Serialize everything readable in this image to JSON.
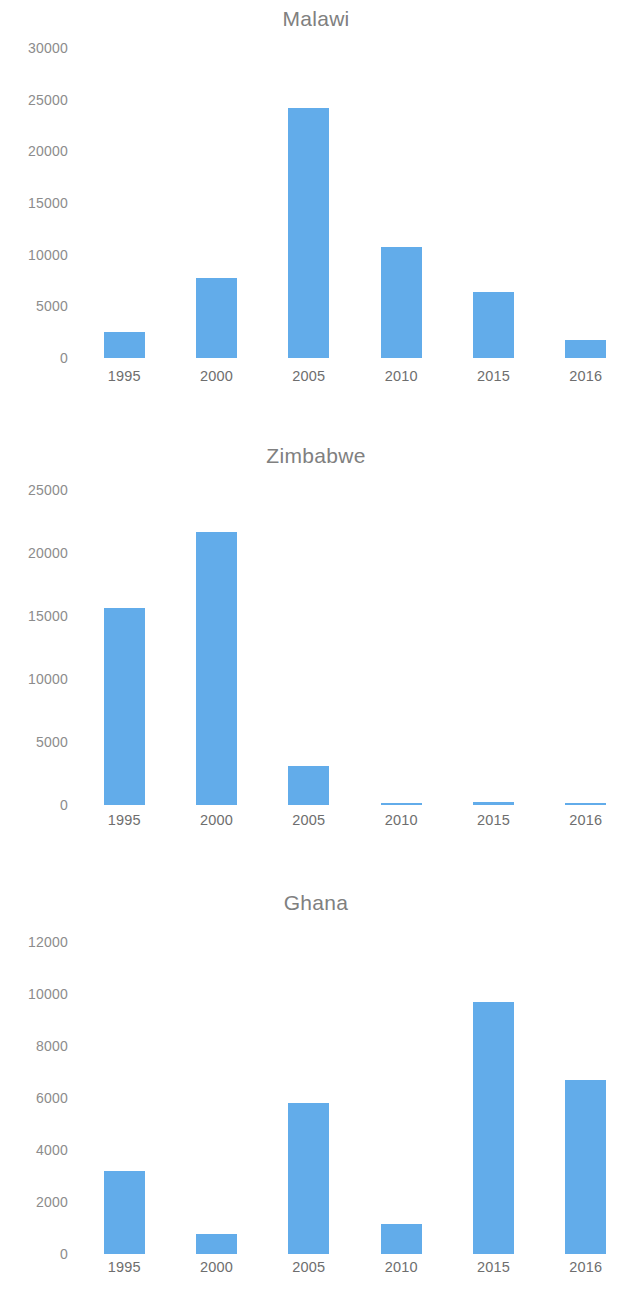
{
  "page": {
    "background_color": "#ffffff",
    "bar_color": "#62ACEA",
    "axis_text_color": "#8c8c8c",
    "title_color": "#808080"
  },
  "chart_data": [
    {
      "type": "bar",
      "title": "Malawi",
      "xlabel": "",
      "ylabel": "",
      "categories": [
        "1995",
        "2000",
        "2005",
        "2010",
        "2015",
        "2016"
      ],
      "values": [
        2500,
        7700,
        24200,
        10700,
        6400,
        1700
      ],
      "ylim": [
        0,
        30000
      ],
      "yticks": [
        0,
        5000,
        10000,
        15000,
        20000,
        25000,
        30000
      ],
      "ytick_labels": [
        "0",
        "5000",
        "10000",
        "15000",
        "20000",
        "25000",
        "30000"
      ],
      "grid": false,
      "legend": "none"
    },
    {
      "type": "bar",
      "title": "Zimbabwe",
      "xlabel": "",
      "ylabel": "",
      "categories": [
        "1995",
        "2000",
        "2005",
        "2010",
        "2015",
        "2016"
      ],
      "values": [
        15600,
        21700,
        3100,
        100,
        250,
        80
      ],
      "ylim": [
        0,
        25000
      ],
      "yticks": [
        0,
        5000,
        10000,
        15000,
        20000,
        25000
      ],
      "ytick_labels": [
        "0",
        "5000",
        "10000",
        "15000",
        "20000",
        "25000"
      ],
      "grid": false,
      "legend": "none"
    },
    {
      "type": "bar",
      "title": "Ghana",
      "xlabel": "",
      "ylabel": "",
      "categories": [
        "1995",
        "2000",
        "2005",
        "2010",
        "2015",
        "2016"
      ],
      "values": [
        3200,
        770,
        5800,
        1150,
        9700,
        6700
      ],
      "ylim": [
        0,
        12000
      ],
      "yticks": [
        0,
        2000,
        4000,
        6000,
        8000,
        10000,
        12000
      ],
      "ytick_labels": [
        "0",
        "2000",
        "4000",
        "6000",
        "8000",
        "10000",
        "12000"
      ],
      "grid": false,
      "legend": "none"
    }
  ]
}
